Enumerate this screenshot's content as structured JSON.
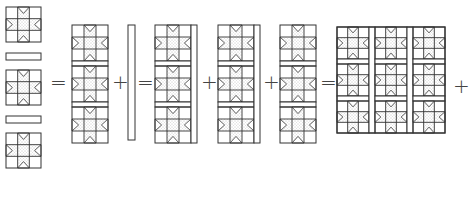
{
  "diagram": {
    "colors": {
      "line": "#333333",
      "fill_star": "#e6e6e6",
      "stipple": "#9a9a9a",
      "background": "#ffffff"
    },
    "step1": {
      "label": "Column: 3 star blocks alternating with 2 horizontal sashing strips",
      "items": [
        "star-block",
        "sashing-strip",
        "star-block",
        "sashing-strip",
        "star-block"
      ]
    },
    "operators": [
      {
        "symbol": "=",
        "x": 50,
        "y": 72
      },
      {
        "symbol": "+",
        "x": 112,
        "y": 72
      },
      {
        "symbol": "=",
        "x": 137,
        "y": 72
      },
      {
        "symbol": "+",
        "x": 201,
        "y": 72
      },
      {
        "symbol": "+",
        "x": 263,
        "y": 72
      },
      {
        "symbol": "=",
        "x": 320,
        "y": 72
      },
      {
        "symbol": "+",
        "x": 453,
        "y": 76
      }
    ],
    "panels": [
      {
        "id": "column",
        "label": "Sewn column of 3 blocks",
        "x": 72,
        "y": 25,
        "w": 36,
        "blocks": 3,
        "right_sashing": false
      },
      {
        "id": "vertical-sashing",
        "label": "Vertical sashing strip",
        "x": 128,
        "y": 25,
        "w": 7,
        "h": 115
      },
      {
        "id": "column-with-sashing-1",
        "label": "Column with vertical sashing",
        "x": 155,
        "y": 25,
        "w": 36,
        "blocks": 3,
        "right_sashing": true
      },
      {
        "id": "column-with-sashing-2",
        "label": "Column with vertical sashing",
        "x": 218,
        "y": 25,
        "w": 36,
        "blocks": 3,
        "right_sashing": true
      },
      {
        "id": "column-3",
        "label": "Column of 3 blocks",
        "x": 280,
        "y": 25,
        "w": 36,
        "blocks": 3,
        "right_sashing": false
      },
      {
        "id": "quilt-top",
        "label": "Assembled quilt top 3x3",
        "x": 337,
        "y": 27,
        "columns": 3,
        "rows": 3
      }
    ]
  }
}
